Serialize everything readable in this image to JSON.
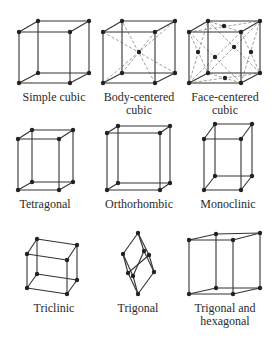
{
  "colors": {
    "line": "#333333",
    "dashed": "#777777",
    "atom": "#222222",
    "background": "#ffffff",
    "text": "#2a2a2a"
  },
  "lattices": [
    {
      "name": "simple-cubic",
      "label_lines": [
        "Simple cubic"
      ],
      "label_x": 9,
      "label_y": 91,
      "points": [
        [
          19,
          32
        ],
        [
          70,
          32
        ],
        [
          19,
          83
        ],
        [
          70,
          83
        ],
        [
          38,
          21
        ],
        [
          89,
          21
        ],
        [
          38,
          73
        ],
        [
          89,
          73
        ]
      ],
      "edges": [
        [
          0,
          1
        ],
        [
          0,
          2
        ],
        [
          1,
          3
        ],
        [
          2,
          3
        ],
        [
          4,
          5
        ],
        [
          4,
          6
        ],
        [
          5,
          7
        ],
        [
          6,
          7
        ],
        [
          0,
          4
        ],
        [
          1,
          5
        ],
        [
          2,
          6
        ],
        [
          3,
          7
        ]
      ],
      "dashed": [],
      "extra_atoms": []
    },
    {
      "name": "body-centered-cubic",
      "label_lines": [
        "Body-centered",
        "cubic"
      ],
      "label_x": 94,
      "label_y": 91,
      "points": [
        [
          103,
          32
        ],
        [
          155,
          32
        ],
        [
          103,
          83
        ],
        [
          155,
          83
        ],
        [
          122,
          21
        ],
        [
          175,
          21
        ],
        [
          122,
          73
        ],
        [
          175,
          73
        ]
      ],
      "edges": [
        [
          0,
          1
        ],
        [
          0,
          2
        ],
        [
          1,
          3
        ],
        [
          2,
          3
        ],
        [
          4,
          5
        ],
        [
          4,
          6
        ],
        [
          5,
          7
        ],
        [
          6,
          7
        ],
        [
          0,
          4
        ],
        [
          1,
          5
        ],
        [
          2,
          6
        ],
        [
          3,
          7
        ]
      ],
      "dashed": [
        [
          0,
          7
        ],
        [
          1,
          6
        ],
        [
          2,
          5
        ],
        [
          3,
          4
        ]
      ],
      "extra_atoms": [
        [
          139,
          52
        ]
      ]
    },
    {
      "name": "face-centered-cubic",
      "label_lines": [
        "Face-centered",
        "cubic"
      ],
      "label_x": 180,
      "label_y": 91,
      "points": [
        [
          189,
          32
        ],
        [
          241,
          32
        ],
        [
          189,
          83
        ],
        [
          241,
          83
        ],
        [
          208,
          21
        ],
        [
          260,
          21
        ],
        [
          208,
          73
        ],
        [
          260,
          73
        ]
      ],
      "edges": [
        [
          0,
          1
        ],
        [
          0,
          2
        ],
        [
          1,
          3
        ],
        [
          2,
          3
        ],
        [
          4,
          5
        ],
        [
          4,
          6
        ],
        [
          5,
          7
        ],
        [
          6,
          7
        ],
        [
          0,
          4
        ],
        [
          1,
          5
        ],
        [
          2,
          6
        ],
        [
          3,
          7
        ]
      ],
      "dashed": [
        [
          0,
          3
        ],
        [
          1,
          2
        ],
        [
          4,
          7
        ],
        [
          5,
          6
        ],
        [
          0,
          5
        ],
        [
          1,
          4
        ],
        [
          2,
          7
        ],
        [
          3,
          6
        ],
        [
          0,
          6
        ],
        [
          2,
          4
        ],
        [
          1,
          7
        ],
        [
          3,
          5
        ]
      ],
      "extra_atoms": [
        [
          215,
          57
        ],
        [
          234,
          47
        ],
        [
          224,
          26
        ],
        [
          225,
          78
        ],
        [
          198,
          52
        ],
        [
          251,
          52
        ]
      ]
    },
    {
      "name": "tetragonal",
      "label_lines": [
        "Tetragonal"
      ],
      "label_x": 0,
      "label_y": 198,
      "points": [
        [
          18,
          139
        ],
        [
          59,
          139
        ],
        [
          18,
          190
        ],
        [
          59,
          190
        ],
        [
          32,
          130
        ],
        [
          73,
          130
        ],
        [
          32,
          182
        ],
        [
          73,
          182
        ]
      ],
      "edges": [
        [
          0,
          1
        ],
        [
          0,
          2
        ],
        [
          1,
          3
        ],
        [
          2,
          3
        ],
        [
          4,
          5
        ],
        [
          4,
          6
        ],
        [
          5,
          7
        ],
        [
          6,
          7
        ],
        [
          0,
          4
        ],
        [
          1,
          5
        ],
        [
          2,
          6
        ],
        [
          3,
          7
        ]
      ],
      "dashed": [],
      "extra_atoms": []
    },
    {
      "name": "orthorhombic",
      "label_lines": [
        "Orthorhombic"
      ],
      "label_x": 94,
      "label_y": 198,
      "points": [
        [
          107,
          133
        ],
        [
          160,
          133
        ],
        [
          107,
          190
        ],
        [
          160,
          190
        ],
        [
          118,
          126
        ],
        [
          170,
          126
        ],
        [
          118,
          183
        ],
        [
          170,
          183
        ]
      ],
      "edges": [
        [
          0,
          1
        ],
        [
          0,
          2
        ],
        [
          1,
          3
        ],
        [
          2,
          3
        ],
        [
          4,
          5
        ],
        [
          4,
          6
        ],
        [
          5,
          7
        ],
        [
          6,
          7
        ],
        [
          0,
          4
        ],
        [
          1,
          5
        ],
        [
          2,
          6
        ],
        [
          3,
          7
        ]
      ],
      "dashed": [],
      "extra_atoms": []
    },
    {
      "name": "monoclinic",
      "label_lines": [
        "Monoclinic"
      ],
      "label_x": 183,
      "label_y": 198,
      "points": [
        [
          204,
          139
        ],
        [
          241,
          139
        ],
        [
          204,
          190
        ],
        [
          241,
          190
        ],
        [
          215,
          124
        ],
        [
          252,
          124
        ],
        [
          215,
          176
        ],
        [
          252,
          176
        ]
      ],
      "edges": [
        [
          0,
          1
        ],
        [
          0,
          2
        ],
        [
          1,
          3
        ],
        [
          2,
          3
        ],
        [
          4,
          5
        ],
        [
          4,
          6
        ],
        [
          5,
          7
        ],
        [
          6,
          7
        ],
        [
          0,
          4
        ],
        [
          1,
          5
        ],
        [
          2,
          6
        ],
        [
          3,
          7
        ]
      ],
      "dashed": [],
      "extra_atoms": []
    },
    {
      "name": "triclinic",
      "label_lines": [
        "Triclinic"
      ],
      "label_x": 9,
      "label_y": 302,
      "points": [
        [
          27,
          254
        ],
        [
          67,
          260
        ],
        [
          27,
          288
        ],
        [
          67,
          294
        ],
        [
          37,
          239
        ],
        [
          77,
          245
        ],
        [
          37,
          274
        ],
        [
          77,
          280
        ]
      ],
      "edges": [
        [
          0,
          1
        ],
        [
          0,
          2
        ],
        [
          1,
          3
        ],
        [
          2,
          3
        ],
        [
          4,
          5
        ],
        [
          4,
          6
        ],
        [
          5,
          7
        ],
        [
          6,
          7
        ],
        [
          0,
          4
        ],
        [
          1,
          5
        ],
        [
          2,
          6
        ],
        [
          3,
          7
        ]
      ],
      "dashed": [],
      "extra_atoms": []
    },
    {
      "name": "trigonal",
      "label_lines": [
        "Trigonal"
      ],
      "label_x": 93,
      "label_y": 302,
      "points": [
        [
          123,
          254
        ],
        [
          144,
          251
        ],
        [
          128,
          273
        ],
        [
          133,
          276
        ],
        [
          138,
          233
        ],
        [
          149,
          255
        ],
        [
          154,
          272
        ],
        [
          138,
          294
        ]
      ],
      "edges": [
        [
          4,
          0
        ],
        [
          4,
          1
        ],
        [
          4,
          5
        ],
        [
          0,
          2
        ],
        [
          0,
          3
        ],
        [
          1,
          3
        ],
        [
          1,
          6
        ],
        [
          5,
          6
        ],
        [
          2,
          7
        ],
        [
          3,
          7
        ],
        [
          6,
          7
        ],
        [
          5,
          2
        ]
      ],
      "dashed": [],
      "extra_atoms": []
    },
    {
      "name": "trigonal-and-hexagonal",
      "label_lines": [
        "Trigonal and",
        "hexagonal"
      ],
      "label_x": 180,
      "label_y": 302,
      "points": [
        [
          189,
          240
        ],
        [
          233,
          240
        ],
        [
          189,
          294
        ],
        [
          233,
          294
        ],
        [
          216,
          234
        ],
        [
          260,
          233
        ],
        [
          216,
          288
        ],
        [
          260,
          288
        ]
      ],
      "edges": [
        [
          0,
          1
        ],
        [
          0,
          2
        ],
        [
          1,
          3
        ],
        [
          2,
          3
        ],
        [
          4,
          5
        ],
        [
          4,
          6
        ],
        [
          5,
          7
        ],
        [
          6,
          7
        ],
        [
          0,
          4
        ],
        [
          1,
          5
        ],
        [
          2,
          6
        ],
        [
          3,
          7
        ]
      ],
      "dashed": [],
      "extra_atoms": []
    }
  ]
}
